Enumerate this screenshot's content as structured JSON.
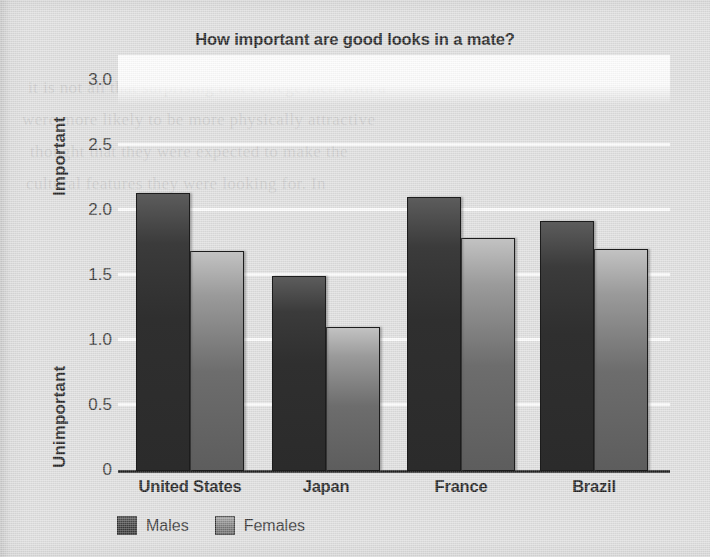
{
  "chart_data": {
    "type": "bar",
    "title": "How important are good looks in a mate?",
    "xlabel": "",
    "ylabel": "",
    "categories": [
      "United States",
      "Japan",
      "France",
      "Brazil"
    ],
    "series": [
      {
        "name": "Males",
        "values": [
          2.14,
          1.5,
          2.11,
          1.92
        ]
      },
      {
        "name": "Females",
        "values": [
          1.69,
          1.11,
          1.79,
          1.71
        ]
      }
    ],
    "ylim": [
      0,
      3.2
    ],
    "ytick_values": [
      0,
      0.5,
      1.0,
      1.5,
      2.0,
      2.5,
      3.0
    ],
    "ytick_labels": [
      "0",
      "0.5",
      "1.0",
      "1.5",
      "2.0",
      "2.5",
      "3.0"
    ],
    "y_axis_low_label": "Unimportant",
    "y_axis_high_label": "Important",
    "grid": true,
    "gridline_color": "#fbfbfb",
    "legend_position": "bottom-left",
    "series_colors": [
      "#2f2f2f",
      "#7a7a7a"
    ],
    "background_color": "#dcdcdc",
    "axis_color": "#111111"
  },
  "axis": {
    "y_title_top": "Important",
    "y_title_bottom": "Unimportant",
    "ticks": [
      {
        "label": "3.0",
        "value": 3.0
      },
      {
        "label": "2.5",
        "value": 2.5
      },
      {
        "label": "2.0",
        "value": 2.0
      },
      {
        "label": "1.5",
        "value": 1.5
      },
      {
        "label": "1.0",
        "value": 1.0
      },
      {
        "label": "0.5",
        "value": 0.5
      },
      {
        "label": "0",
        "value": 0
      }
    ]
  },
  "legend": {
    "items": [
      {
        "label": "Males",
        "color": "#2f2f2f"
      },
      {
        "label": "Females",
        "color": "#7a7a7a"
      }
    ]
  },
  "page_artifacts": {
    "note": "faint show-through text from reverse side of scanned page",
    "ghost_lines": [
      "it is not all that surprising that college men with a",
      "were more likely to be more physically attractive",
      "thought that they were expected to make the",
      "cultural features they were looking for. In"
    ]
  }
}
